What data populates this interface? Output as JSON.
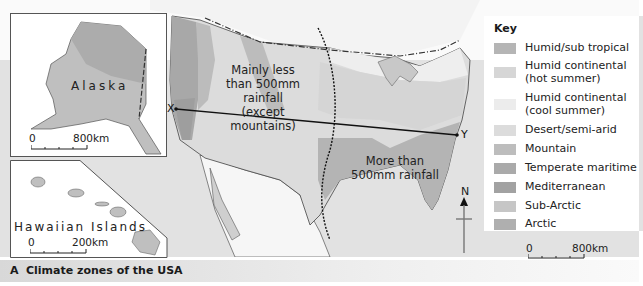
{
  "caption": {
    "letter": "A",
    "title": "Climate zones of the USA"
  },
  "insets": {
    "alaska": {
      "label": "Alaska",
      "scale": {
        "start": "0",
        "end": "800km"
      }
    },
    "hawaii": {
      "label": "Hawaiian Islands",
      "scale": {
        "start": "0",
        "end": "200km"
      }
    }
  },
  "main_map": {
    "notes": {
      "west": "Mainly less\nthan 500mm rainfall\n(except mountains)",
      "east": "More than\n500mm rainfall"
    },
    "transect": {
      "start": "X",
      "end": "Y"
    },
    "compass": {
      "label": "N"
    },
    "scale": {
      "start": "0",
      "end": "800km"
    }
  },
  "key": {
    "title": "Key",
    "items": [
      {
        "label": "Humid/sub tropical",
        "color": "#b5b5b5"
      },
      {
        "label": "Humid continental\n(hot summer)",
        "color": "#d6d6d6"
      },
      {
        "label": "Humid continental\n(cool summer)",
        "color": "#ececec"
      },
      {
        "label": "Desert/semi-arid",
        "color": "#dcdcdc"
      },
      {
        "label": "Mountain",
        "color": "#bdbdbd"
      },
      {
        "label": "Temperate maritime",
        "color": "#aaaaaa"
      },
      {
        "label": "Mediterranean",
        "color": "#a2a2a2"
      },
      {
        "label": "Sub-Arctic",
        "color": "#c6c6c6"
      },
      {
        "label": "Arctic",
        "color": "#afafaf"
      }
    ]
  },
  "colors": {
    "ocean": "#dedede",
    "foreign_land": "#f4f4f4",
    "border": "#444444"
  }
}
